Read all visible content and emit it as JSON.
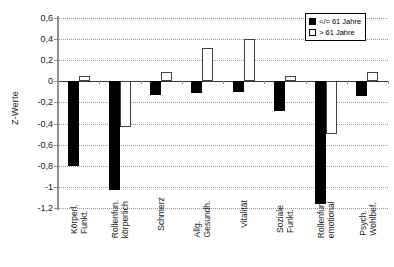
{
  "chart_data": {
    "type": "bar",
    "title": "",
    "xlabel": "",
    "ylabel": "Z-Werte",
    "ylim": [
      -1.2,
      0.6
    ],
    "yticks": [
      0.6,
      0.4,
      0.2,
      0,
      -0.2,
      -0.4,
      -0.6,
      -0.8,
      -1,
      -1.2
    ],
    "ytick_labels": [
      "0,6",
      "0,4",
      "0,2",
      "0",
      "-0,2",
      "-0,4",
      "-0,6",
      "-0,8",
      "-1",
      "-1,2"
    ],
    "grid": true,
    "legend_position": "top-right",
    "categories": [
      "Körperl. Funkt.",
      "Rollenfun. körperlich",
      "Schmerz",
      "Allg. Gesundh.",
      "Vitalität",
      "Soziale Funkt.",
      "Rollenfun. emotional",
      "Psych. Wohlbef."
    ],
    "category_lines": [
      [
        "Körperl.",
        "Funkt."
      ],
      [
        "Rollenfun.",
        "körperlich"
      ],
      [
        "Schmerz",
        ""
      ],
      [
        "Allg.",
        "Gesundh."
      ],
      [
        "Vitalität",
        ""
      ],
      [
        "Soziale",
        "Funkt."
      ],
      [
        "Rollenfun.",
        "emotional"
      ],
      [
        "Psych.",
        "Wohlbef."
      ]
    ],
    "series": [
      {
        "name": "</= 61 Jahre",
        "color": "#000000",
        "values": [
          -0.8,
          -1.03,
          -0.13,
          -0.11,
          -0.1,
          -0.28,
          -1.16,
          -0.14
        ]
      },
      {
        "name": "> 61 Jahre",
        "color": "#ffffff",
        "values": [
          0.05,
          -0.43,
          0.09,
          0.32,
          0.4,
          0.05,
          -0.5,
          0.09
        ]
      }
    ]
  },
  "legend": {
    "entries": [
      {
        "label": "</= 61 Jahre",
        "marker": "filled-square"
      },
      {
        "label": "> 61 Jahre",
        "marker": "hollow-square"
      }
    ]
  },
  "axis": {
    "y_title": "Z-Werte"
  }
}
